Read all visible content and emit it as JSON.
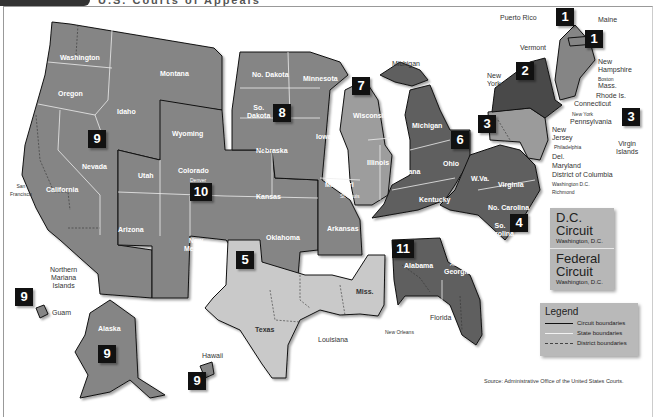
{
  "header": {
    "exhibit_label": "Exhibit 3-5",
    "title": "U.S. Courts of Appeals"
  },
  "circuits": [
    {
      "number": "1",
      "states": [
        "Maine",
        "New Hampshire",
        "Massachusetts",
        "Rhode Island",
        "Puerto Rico"
      ]
    },
    {
      "number": "2",
      "states": [
        "New York",
        "Vermont",
        "Connecticut"
      ]
    },
    {
      "number": "3",
      "states": [
        "Pennsylvania",
        "New Jersey",
        "Delaware",
        "Virgin Islands"
      ]
    },
    {
      "number": "4",
      "states": [
        "Maryland",
        "West Virginia",
        "Virginia",
        "North Carolina",
        "South Carolina"
      ]
    },
    {
      "number": "5",
      "states": [
        "Texas",
        "Louisiana",
        "Mississippi"
      ]
    },
    {
      "number": "6",
      "states": [
        "Michigan",
        "Ohio",
        "Kentucky",
        "Tennessee"
      ]
    },
    {
      "number": "7",
      "states": [
        "Wisconsin",
        "Illinois",
        "Indiana"
      ]
    },
    {
      "number": "8",
      "states": [
        "North Dakota",
        "South Dakota",
        "Nebraska",
        "Minnesota",
        "Iowa",
        "Missouri",
        "Arkansas"
      ]
    },
    {
      "number": "9",
      "states": [
        "Washington",
        "Oregon",
        "California",
        "Idaho",
        "Montana",
        "Nevada",
        "Arizona",
        "Alaska",
        "Hawaii",
        "Guam",
        "Northern Mariana Islands"
      ]
    },
    {
      "number": "10",
      "states": [
        "Wyoming",
        "Utah",
        "Colorado",
        "Kansas",
        "Oklahoma",
        "New Mexico"
      ]
    },
    {
      "number": "11",
      "states": [
        "Alabama",
        "Georgia",
        "Florida"
      ]
    }
  ],
  "badges": {
    "c1a": "1",
    "c1b": "1",
    "c2": "2",
    "c3a": "3",
    "c3b": "3",
    "c4": "4",
    "c5": "5",
    "c6": "6",
    "c7": "7",
    "c8": "8",
    "c9a": "9",
    "c9b": "9",
    "c9c": "9",
    "c9d": "9",
    "c10": "10",
    "c11": "11"
  },
  "states": {
    "washington": "Washington",
    "oregon": "Oregon",
    "idaho": "Idaho",
    "montana": "Montana",
    "nevada": "Nevada",
    "california": "California",
    "arizona": "Arizona",
    "wyoming": "Wyoming",
    "utah": "Utah",
    "colorado": "Colorado",
    "kansas": "Kansas",
    "new_mexico": "New\nMexico",
    "oklahoma": "Oklahoma",
    "no_dakota": "No. Dakota",
    "so_dakota": "So.\nDakota",
    "nebraska": "Nebraska",
    "minnesota": "Minnesota",
    "iowa": "Iowa",
    "missouri": "Missouri",
    "arkansas": "Arkansas",
    "wisconsin": "Wisconsin",
    "illinois": "Illinois",
    "indiana": "Indiana",
    "michigan": "Michigan",
    "ohio": "Ohio",
    "kentucky": "Kentucky",
    "tennessee": "Tennessee",
    "wva": "W.Va.",
    "virginia": "Virginia",
    "no_carolina": "No. Carolina",
    "so_carolina": "So.\nCarolina",
    "texas": "Texas",
    "miss": "Miss.",
    "alabama": "Alabama",
    "georgia": "Georgia",
    "alaska": "Alaska"
  },
  "external_labels": {
    "puerto_rico": "Puerto Rico",
    "maine": "Maine",
    "vermont": "Vermont",
    "new_york": "New\nYork",
    "new_hampshire": "New\nHampshire",
    "boston": "Boston",
    "mass": "Mass.",
    "rhode_is": "Rhode Is.",
    "connecticut": "Connecticut",
    "new_york_city": "New York",
    "pennsylvania": "Pennsylvania",
    "new_jersey": "New\nJersey",
    "philadelphia": "Philadelphia",
    "virgin_islands": "Virgin\nIslands",
    "del": "Del.",
    "maryland": "Maryland",
    "dc": "District of Columbia",
    "washington_dc": "Washington D.C.",
    "richmond": "Richmond",
    "michigan_up": "Michigan",
    "san_francisco": "San\nFrancisco",
    "denver": "Denver",
    "st_louis": "St. Louis",
    "atlanta": "Atlanta",
    "new_orleans": "New Orleans",
    "louisiana": "Louisiana",
    "florida": "Florida",
    "northern_mariana": "Northern\nMariana\nIslands",
    "guam": "Guam",
    "hawaii": "Hawaii"
  },
  "dc_circuit": {
    "title": "D.C.\nCircuit",
    "location": "Washington, D.C."
  },
  "federal_circuit": {
    "title": "Federal\nCircuit",
    "location": "Washington, D.C."
  },
  "legend": {
    "title": "Legend",
    "items": [
      {
        "label": "Circuit boundaries",
        "color": "#111111",
        "style": "solid"
      },
      {
        "label": "State boundaries",
        "color": "#f2f2f2",
        "style": "solid"
      },
      {
        "label": "District boundaries",
        "color": "#444444",
        "style": "dashed"
      }
    ]
  },
  "source": "Source: Administrative Office of the United States Courts.",
  "colors": {
    "circuit_medium": "#858585",
    "circuit_dark": "#5e5e5e",
    "circuit_light": "#c9c9c9",
    "circuit_darkest": "#4a4a4a",
    "badge": "#111111",
    "panel": "#b8b8b8"
  }
}
